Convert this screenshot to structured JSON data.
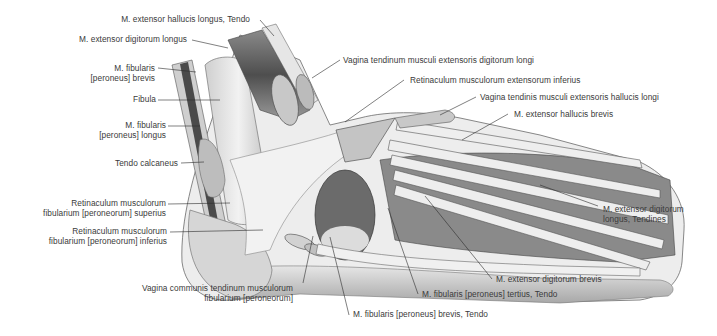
{
  "figure": {
    "labels": [
      {
        "id": "ehl-tendo",
        "text": "M. extensor hallucis longus, Tendo"
      },
      {
        "id": "edl",
        "text": "M. extensor digitorum longus"
      },
      {
        "id": "fib-brevis",
        "line1": "M. fibularis",
        "line2": "[peroneus] brevis"
      },
      {
        "id": "fibula",
        "text": "Fibula"
      },
      {
        "id": "fib-longus",
        "line1": "M. fibularis",
        "line2": "[peroneus] longus"
      },
      {
        "id": "tendo-calcaneus",
        "text": "Tendo calcaneus"
      },
      {
        "id": "ret-sup",
        "line1": "Retinaculum musculorum",
        "line2": "fibularium [peroneorum] superius"
      },
      {
        "id": "ret-inf",
        "line1": "Retinaculum musculorum",
        "line2": "fibularium [peroneorum] inferius"
      },
      {
        "id": "vag-communis",
        "line1": "Vagina communis tendinum musculorum",
        "line2": "fibularium [peroneorum]"
      },
      {
        "id": "fib-brevis-tendo",
        "text": "M. fibularis [peroneus] brevis, Tendo"
      },
      {
        "id": "fib-tertius-tendo",
        "text": "M. fibularis [peroneus] tertius, Tendo"
      },
      {
        "id": "edb",
        "text": "M. extensor digitorum brevis"
      },
      {
        "id": "edl-tendines",
        "line1": "M. extensor digitorum",
        "line2": "longus, Tendines"
      },
      {
        "id": "ehb",
        "text": "M. extensor hallucis brevis"
      },
      {
        "id": "vag-ehl",
        "text": "Vagina tendinis musculi extensoris hallucis longi"
      },
      {
        "id": "ret-ext-inf",
        "text": "Retinaculum musculorum extensorum inferius"
      },
      {
        "id": "vag-edl",
        "text": "Vagina tendinum musculi extensoris digitorum longi"
      }
    ]
  },
  "colors": {
    "background": "#ffffff",
    "label_text": "#3a3a3a",
    "leader_line": "#2b2b2b",
    "bone": "#d9d9d9",
    "tendon": "#ececec",
    "muscle_dark": "#5a5a5a",
    "sheath": "#bdbdbd"
  }
}
